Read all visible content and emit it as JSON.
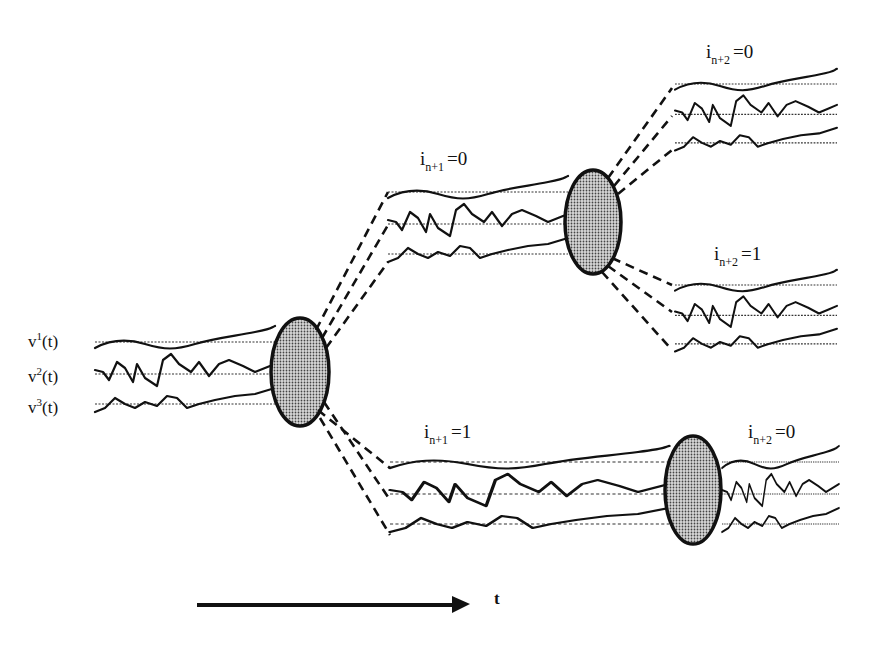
{
  "diagram": {
    "type": "branching-tree-of-signal-trajectories",
    "signals": {
      "v1": {
        "base": "v",
        "sup": "1",
        "arg": "(t)"
      },
      "v2": {
        "base": "v",
        "sup": "2",
        "arg": "(t)"
      },
      "v3": {
        "base": "v",
        "sup": "3",
        "arg": "(t)"
      }
    },
    "branches": {
      "n1_0": {
        "i": "i",
        "sub": "n+1",
        "eq": "=0"
      },
      "n1_1": {
        "i": "i",
        "sub": "n+1",
        "eq": "=1"
      },
      "n2_0_top": {
        "i": "i",
        "sub": "n+2",
        "eq": "=0"
      },
      "n2_1": {
        "i": "i",
        "sub": "n+2",
        "eq": "=1"
      },
      "n2_0_bottom": {
        "i": "i",
        "sub": "n+2",
        "eq": "=0"
      }
    },
    "time_axis": {
      "label": "t"
    },
    "colors": {
      "ink": "#111111",
      "node_fill": "#9a9a9a",
      "background": "#ffffff"
    }
  }
}
